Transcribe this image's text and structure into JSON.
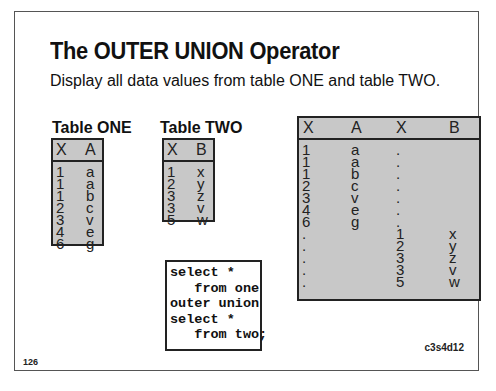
{
  "slide": {
    "title": "The OUTER UNION Operator",
    "subtitle": "Display all data values from table ONE and table TWO.",
    "page_number": "126",
    "slide_code": "c3s4d12"
  },
  "table_one": {
    "label": "Table ONE",
    "columns": [
      "X",
      "A"
    ],
    "rows": [
      [
        "1",
        "a"
      ],
      [
        "1",
        "a"
      ],
      [
        "1",
        "b"
      ],
      [
        "2",
        "c"
      ],
      [
        "3",
        "v"
      ],
      [
        "4",
        "e"
      ],
      [
        "6",
        "g"
      ]
    ]
  },
  "table_two": {
    "label": "Table TWO",
    "columns": [
      "X",
      "B"
    ],
    "rows": [
      [
        "1",
        "x"
      ],
      [
        "2",
        "y"
      ],
      [
        "3",
        "z"
      ],
      [
        "3",
        "v"
      ],
      [
        "5",
        "w"
      ]
    ]
  },
  "sql_code": "select *\n   from one\nouter union\nselect *\n   from two;",
  "result_table": {
    "columns": [
      "X",
      "A",
      "X",
      "B"
    ],
    "rows": [
      [
        "1",
        "a",
        ".",
        ""
      ],
      [
        "1",
        "a",
        ".",
        ""
      ],
      [
        "1",
        "b",
        ".",
        ""
      ],
      [
        "2",
        "c",
        ".",
        ""
      ],
      [
        "3",
        "v",
        ".",
        ""
      ],
      [
        "4",
        "e",
        ".",
        ""
      ],
      [
        "6",
        "g",
        ".",
        ""
      ],
      [
        ".",
        "",
        "1",
        "x"
      ],
      [
        ".",
        "",
        "2",
        "y"
      ],
      [
        ".",
        "",
        "3",
        "z"
      ],
      [
        ".",
        "",
        "3",
        "v"
      ],
      [
        ".",
        "",
        "5",
        "w"
      ]
    ]
  }
}
